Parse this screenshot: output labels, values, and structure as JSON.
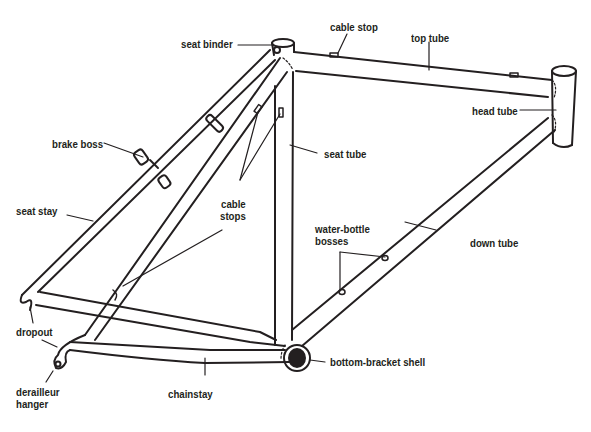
{
  "diagram": {
    "type": "labeled-illustration",
    "line_color": "#231f20",
    "background": "#ffffff"
  },
  "labels": {
    "seat_binder": "seat binder",
    "cable_stop": "cable stop",
    "top_tube": "top tube",
    "head_tube": "head tube",
    "brake_boss": "brake boss",
    "seat_tube": "seat tube",
    "seat_stay": "seat stay",
    "cable_stops_1": "cable",
    "cable_stops_2": "stops",
    "water_bottle_1": "water-bottle",
    "water_bottle_2": "bosses",
    "down_tube": "down tube",
    "dropout": "dropout",
    "bottom_bracket_shell": "bottom-bracket shell",
    "derailleur_1": "derailleur",
    "derailleur_2": "hanger",
    "chainstay": "chainstay"
  }
}
